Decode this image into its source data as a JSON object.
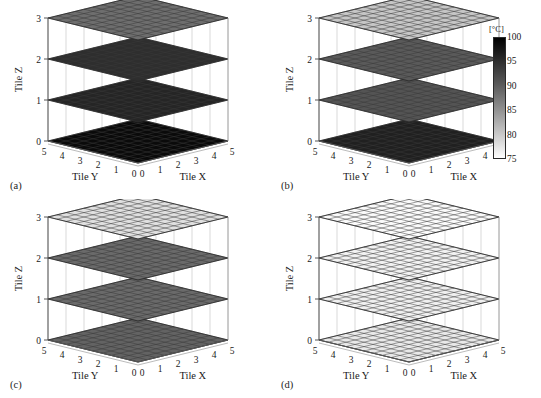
{
  "figure": {
    "background": "#ffffff",
    "panel_count": 4
  },
  "colorbar": {
    "name": "temperature-colorbar",
    "unit_label": "[°C]",
    "min": 75,
    "max": 100,
    "ticks": [
      100,
      95,
      90,
      85,
      80,
      75
    ],
    "low_color": "#ffffff",
    "high_color": "#000000",
    "orientation": "vertical"
  },
  "axes": {
    "x_label": "Tile X",
    "y_label": "Tile Y",
    "z_label": "Tile Z",
    "x_ticks": [
      "0",
      "1",
      "2",
      "3",
      "4",
      "5"
    ],
    "y_ticks": [
      "5",
      "4",
      "3",
      "2",
      "1",
      "0"
    ],
    "z_ticks": [
      "0",
      "1",
      "2",
      "3"
    ],
    "grid_cells_per_side": 10,
    "grid_color": "#3a3a3a"
  },
  "panels": [
    {
      "tag": "(a)",
      "name": "panel-a",
      "layers": [
        {
          "z": 3,
          "temperature": 88,
          "fill": "#6e6e6e"
        },
        {
          "z": 2,
          "temperature": 96,
          "fill": "#2e2e2e"
        },
        {
          "z": 1,
          "temperature": 97,
          "fill": "#252525"
        },
        {
          "z": 0,
          "temperature": 100,
          "fill": "#0a0a0a"
        }
      ]
    },
    {
      "tag": "(b)",
      "name": "panel-b",
      "layers": [
        {
          "z": 3,
          "temperature": 80,
          "fill": "#c6c6c6"
        },
        {
          "z": 2,
          "temperature": 90,
          "fill": "#5a5a5a"
        },
        {
          "z": 1,
          "temperature": 91,
          "fill": "#545454"
        },
        {
          "z": 0,
          "temperature": 97,
          "fill": "#202020"
        }
      ]
    },
    {
      "tag": "(c)",
      "name": "panel-c",
      "layers": [
        {
          "z": 3,
          "temperature": 78,
          "fill": "#e0e0e0"
        },
        {
          "z": 2,
          "temperature": 88,
          "fill": "#6a6a6a"
        },
        {
          "z": 1,
          "temperature": 88,
          "fill": "#6a6a6a"
        },
        {
          "z": 0,
          "temperature": 89,
          "fill": "#636363"
        }
      ]
    },
    {
      "tag": "(d)",
      "name": "panel-d",
      "layers": [
        {
          "z": 3,
          "temperature": 75,
          "fill": "#fbfbfb"
        },
        {
          "z": 2,
          "temperature": 76,
          "fill": "#f2f2f2"
        },
        {
          "z": 1,
          "temperature": 76,
          "fill": "#f0f0f0"
        },
        {
          "z": 0,
          "temperature": 77,
          "fill": "#e9e9e9"
        }
      ]
    }
  ],
  "chart_data": {
    "type": "heatmap",
    "title": "",
    "subtitle": "",
    "xlabel": "Tile X",
    "ylabel": "Tile Y",
    "zlabel": "Tile Z",
    "colorbar_label": "[°C]",
    "colorbar_range": [
      75,
      100
    ],
    "colorbar_ticks": [
      75,
      80,
      85,
      90,
      95,
      100
    ],
    "xlim": [
      0,
      5
    ],
    "ylim": [
      0,
      5
    ],
    "zlim": [
      0,
      3
    ],
    "x_tick_labels": [
      "0",
      "1",
      "2",
      "3",
      "4",
      "5"
    ],
    "y_tick_labels": [
      "5",
      "4",
      "3",
      "2",
      "1",
      "0"
    ],
    "z_tick_labels": [
      "0",
      "1",
      "2",
      "3"
    ],
    "grid": true,
    "legend_position": "right",
    "subplot_layout": [
      2,
      2
    ],
    "subplots": [
      {
        "label": "(a)",
        "layer_z": [
          0,
          1,
          2,
          3
        ],
        "layer_mean_temperature": [
          100,
          97,
          96,
          88
        ]
      },
      {
        "label": "(b)",
        "layer_z": [
          0,
          1,
          2,
          3
        ],
        "layer_mean_temperature": [
          97,
          91,
          90,
          80
        ]
      },
      {
        "label": "(c)",
        "layer_z": [
          0,
          1,
          2,
          3
        ],
        "layer_mean_temperature": [
          89,
          88,
          88,
          78
        ]
      },
      {
        "label": "(d)",
        "layer_z": [
          0,
          1,
          2,
          3
        ],
        "layer_mean_temperature": [
          77,
          76,
          76,
          75
        ]
      }
    ]
  }
}
